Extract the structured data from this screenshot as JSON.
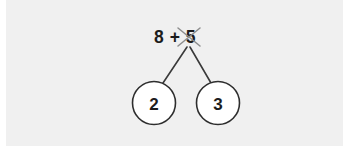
{
  "canvas": {
    "width": 343,
    "height": 152,
    "page_background": "#ffffff",
    "panel_background": "#f0f0f0"
  },
  "worksheet": {
    "title": "Number bond with crossed-out addend",
    "expression": {
      "text": "8 + 5",
      "color": "#1c1c1c",
      "center_x": 175,
      "center_y": 37
    },
    "cross_out": {
      "name": "x-strikethrough",
      "target": "5",
      "color": "#8d8d8d",
      "center_x": 189,
      "center_y": 37,
      "arm_half_length": 11
    },
    "branches": [
      {
        "name": "left-branch",
        "from_x": 187,
        "from_y": 47,
        "to_x": 163,
        "to_y": 83,
        "color": "#3a3a3a"
      },
      {
        "name": "right-branch",
        "from_x": 190,
        "from_y": 47,
        "to_x": 211,
        "to_y": 83,
        "color": "#3a3a3a"
      }
    ],
    "nodes": [
      {
        "name": "left-node",
        "value": "2",
        "cx": 154,
        "cy": 103,
        "r": 21.5,
        "fill": "#ffffff",
        "stroke": "#2e2e2e"
      },
      {
        "name": "right-node",
        "value": "3",
        "cx": 218,
        "cy": 103,
        "r": 21.5,
        "fill": "#ffffff",
        "stroke": "#2e2e2e"
      }
    ]
  }
}
